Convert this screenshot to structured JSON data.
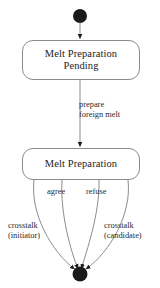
{
  "diagram": {
    "kind": "uml-state-machine-diagram",
    "background_color": "#ffffff",
    "line_color": "#8c8c8c",
    "node_fill_color": "#1b1b1b",
    "text_color": "#1b1b1b",
    "nodes": {
      "initial_state": {
        "name": "initial-state",
        "shape": "filled-circle",
        "cx": 80,
        "cy": 16,
        "r": 7
      },
      "final_state": {
        "name": "final-state",
        "shape": "filled-circle",
        "cx": 80,
        "cy": 274,
        "r": 7.5
      },
      "state_pending": {
        "name": "state-melt-preparation-pending",
        "line1": "Melt Preparation",
        "line2": "Pending"
      },
      "state_preparation": {
        "name": "state-melt-preparation",
        "line1": "Melt Preparation"
      }
    },
    "transitions": [
      {
        "id": "initial-to-pending",
        "from": "initial-state",
        "to": "state-melt-preparation-pending",
        "label": ""
      },
      {
        "id": "pending-to-preparation",
        "from": "state-melt-preparation-pending",
        "to": "state-melt-preparation",
        "label_line1": "prepare",
        "label_line2": "foreign melt"
      },
      {
        "id": "preparation-to-final-agree",
        "from": "state-melt-preparation",
        "to": "final-state",
        "label": "agree"
      },
      {
        "id": "preparation-to-final-refuse",
        "from": "state-melt-preparation",
        "to": "final-state",
        "label": "refuse"
      },
      {
        "id": "preparation-to-final-crosstalk-initiator",
        "from": "state-melt-preparation",
        "to": "final-state",
        "label_line1": "crosstalk",
        "label_line2": "(initiator)"
      },
      {
        "id": "preparation-to-final-crosstalk-candidate",
        "from": "state-melt-preparation",
        "to": "final-state",
        "label_line1": "crosstalk",
        "label_line2": "(candidate)"
      }
    ]
  }
}
